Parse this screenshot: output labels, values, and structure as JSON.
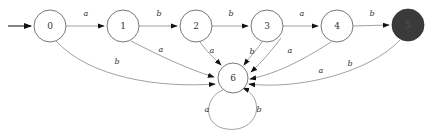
{
  "figure": {
    "kind": "finite-state-automaton-diagram",
    "width": 439,
    "height": 135,
    "background_color": "#ffffff",
    "node_stroke_color": "#555555",
    "edge_stroke_color": "#777777",
    "accepting_fill_color": "#3a3a3a",
    "label_color": "#333333"
  },
  "start_marker": {
    "name": "start-arrow",
    "from_x": 8,
    "to_x": 33,
    "y": 26,
    "target_state": "0"
  },
  "states": [
    {
      "id": "s0",
      "label": "0",
      "cx": 50,
      "cy": 26,
      "r": 16,
      "accepting": false
    },
    {
      "id": "s1",
      "label": "1",
      "cx": 123,
      "cy": 26,
      "r": 16,
      "accepting": false
    },
    {
      "id": "s2",
      "label": "2",
      "cx": 196,
      "cy": 26,
      "r": 16,
      "accepting": false
    },
    {
      "id": "s3",
      "label": "3",
      "cx": 267,
      "cy": 26,
      "r": 16,
      "accepting": false
    },
    {
      "id": "s4",
      "label": "4",
      "cx": 337,
      "cy": 26,
      "r": 16,
      "accepting": false
    },
    {
      "id": "s5",
      "label": "5",
      "cx": 408,
      "cy": 25,
      "r": 16,
      "accepting": true
    },
    {
      "id": "s6",
      "label": "6",
      "cx": 233,
      "cy": 78,
      "r": 15,
      "accepting": false
    }
  ],
  "transitions": [
    {
      "id": "t0",
      "from": "s0",
      "to": "s1",
      "symbol": "a",
      "label_x": 86,
      "label_y": 14
    },
    {
      "id": "t1",
      "from": "s1",
      "to": "s2",
      "symbol": "b",
      "label_x": 159,
      "label_y": 14
    },
    {
      "id": "t2",
      "from": "s2",
      "to": "s3",
      "symbol": "b",
      "label_x": 231,
      "label_y": 14
    },
    {
      "id": "t3",
      "from": "s3",
      "to": "s4",
      "symbol": "a",
      "label_x": 302,
      "label_y": 14
    },
    {
      "id": "t4",
      "from": "s4",
      "to": "s5",
      "symbol": "b",
      "label_x": 372,
      "label_y": 14
    },
    {
      "id": "t5",
      "from": "s0",
      "to": "s6",
      "symbol": "b",
      "label_x": 117,
      "label_y": 62
    },
    {
      "id": "t6",
      "from": "s1",
      "to": "s6",
      "symbol": "a",
      "label_x": 161,
      "label_y": 50
    },
    {
      "id": "t7",
      "from": "s2",
      "to": "s6",
      "symbol": "a",
      "label_x": 212,
      "label_y": 51
    },
    {
      "id": "t8",
      "from": "s3",
      "to": "s6",
      "symbol": "b",
      "label_x": 252,
      "label_y": 52
    },
    {
      "id": "t9",
      "from": "s3",
      "to": "s6",
      "symbol": "a",
      "label_x": 290,
      "label_y": 51
    },
    {
      "id": "t10",
      "from": "s4",
      "to": "s6",
      "symbol": "a",
      "label_x": 321,
      "label_y": 71
    },
    {
      "id": "t11",
      "from": "s5",
      "to": "s6",
      "symbol": "b",
      "label_x": 350,
      "label_y": 64
    },
    {
      "id": "t12",
      "from": "s6",
      "to": "s6",
      "symbol": "a",
      "label_x": 207,
      "label_y": 110
    },
    {
      "id": "t13",
      "from": "s6",
      "to": "s6",
      "symbol": "b",
      "label_x": 259,
      "label_y": 110
    }
  ],
  "self_loop": {
    "name": "state-6-self-loop",
    "cx": 233,
    "cy": 103,
    "r": 22,
    "symbols": [
      "a",
      "b"
    ]
  }
}
